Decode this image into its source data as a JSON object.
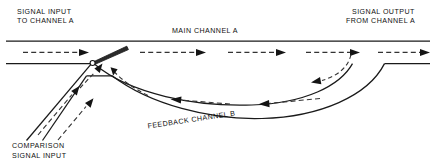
{
  "diagram": {
    "width": 436,
    "height": 165,
    "background_color": "#ffffff",
    "line_color": "#1a1a1a",
    "flow_color": "#333333",
    "text_color": "#111111"
  },
  "labels": {
    "signal_input_line1": "SIGNAL INPUT",
    "signal_input_line2": "TO CHANNEL A",
    "signal_output_line1": "SIGNAL OUTPUT",
    "signal_output_line2": "FROM CHANNEL A",
    "main_channel": "MAIN  CHANNEL  A",
    "feedback_channel": "FEEDBACK CHANNEL B",
    "comparison_line1": "COMPARISON",
    "comparison_line2": "SIGNAL INPUT"
  },
  "flow_arrows": [
    {
      "name": "main-inlet-flow",
      "direction": "right",
      "channel": "main-channel-a"
    },
    {
      "name": "main-midstream-flow",
      "direction": "right",
      "channel": "main-channel-a"
    },
    {
      "name": "main-outlet-flow",
      "direction": "right",
      "channel": "main-channel-a"
    },
    {
      "name": "comparison-inlet-flow",
      "direction": "up-right",
      "channel": "comparison-input"
    },
    {
      "name": "comparison-secondary-flow",
      "direction": "up-right",
      "channel": "comparison-input"
    },
    {
      "name": "feedback-return-flow-right",
      "direction": "left",
      "channel": "feedback-channel-b"
    },
    {
      "name": "feedback-return-flow-left",
      "direction": "left",
      "channel": "feedback-channel-b"
    },
    {
      "name": "feedback-injection-flow",
      "direction": "up",
      "channel": "feedback-channel-b"
    },
    {
      "name": "feedback-tap-flow",
      "direction": "down-left",
      "channel": "feedback-channel-b"
    }
  ],
  "components": [
    {
      "name": "splitter-wedge",
      "type": "flow-splitter"
    },
    {
      "name": "junction-pivot",
      "type": "junction-point"
    }
  ]
}
